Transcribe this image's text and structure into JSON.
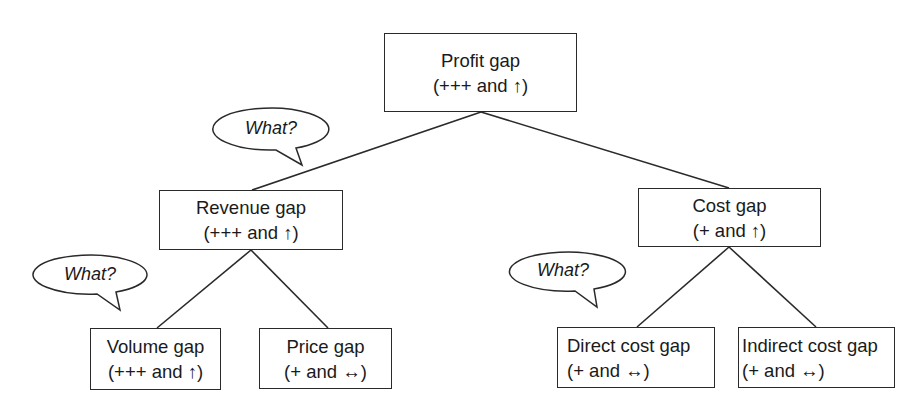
{
  "diagram": {
    "type": "tree",
    "nodes": {
      "profit": {
        "title": "Profit gap",
        "detail": "(+++ and ↑)"
      },
      "revenue": {
        "title": "Revenue gap",
        "detail": "(+++ and ↑)"
      },
      "cost": {
        "title": "Cost gap",
        "detail": "(+ and ↑)"
      },
      "volume": {
        "title": "Volume gap",
        "detail": "(+++ and ↑)"
      },
      "price": {
        "title": "Price gap",
        "detail": "(+ and ↔)"
      },
      "direct": {
        "title": "Direct cost gap",
        "detail": "(+ and  ↔)"
      },
      "indirect": {
        "title": "Indirect cost gap",
        "detail": "(+ and ↔)"
      }
    },
    "edges": [
      [
        "profit",
        "revenue"
      ],
      [
        "profit",
        "cost"
      ],
      [
        "revenue",
        "volume"
      ],
      [
        "revenue",
        "price"
      ],
      [
        "cost",
        "direct"
      ],
      [
        "cost",
        "indirect"
      ]
    ],
    "callouts": [
      {
        "text": "What?",
        "attached_to": "profit-revenue"
      },
      {
        "text": "What?",
        "attached_to": "revenue-volume"
      },
      {
        "text": "What?",
        "attached_to": "cost-direct"
      }
    ],
    "symbols": {
      "up_arrow": "↑",
      "both_arrow": "↔"
    }
  }
}
